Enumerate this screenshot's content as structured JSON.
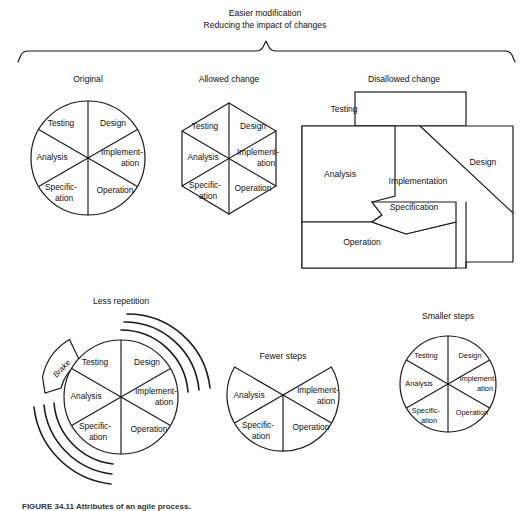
{
  "figure": {
    "header": {
      "line1": "Easier modification",
      "line2": "Reducing the impact of changes"
    },
    "caption": "FIGURE 34.11  Attributes of an agile process."
  },
  "phases": {
    "testing": "Testing",
    "design": "Design",
    "analysis": "Analysis",
    "implementation_line1": "Implement-",
    "implementation_line2": "ation",
    "implementation_full": "Implementation",
    "specification_line1": "Specific-",
    "specification_line2": "ation",
    "specification_full": "Specification",
    "operation": "Operation"
  },
  "panels": [
    {
      "id": "original",
      "title": "Original",
      "shape": "circle",
      "sectors": [
        "Design",
        "Implementation",
        "Operation",
        "Specification",
        "Analysis",
        "Testing"
      ]
    },
    {
      "id": "allowed-change",
      "title": "Allowed change",
      "shape": "hexagon",
      "sectors": [
        "Design",
        "Implementation",
        "Operation",
        "Specification",
        "Analysis",
        "Testing"
      ]
    },
    {
      "id": "disallowed-change",
      "title": "Disallowed change",
      "shape": "irregular-polygon",
      "sectors": [
        "Testing",
        "Analysis",
        "Design",
        "Implementation",
        "Specification",
        "Operation"
      ]
    },
    {
      "id": "less-repetition",
      "title": "Less repetition",
      "shape": "circle-with-brake",
      "sectors": [
        "Design",
        "Implementation",
        "Operation",
        "Specification",
        "Analysis",
        "Testing"
      ],
      "brake_label": "Brake",
      "motion_arc_count": 6
    },
    {
      "id": "fewer-steps",
      "title": "Fewer steps",
      "shape": "partial-circle",
      "sectors": [
        "Implementation",
        "Operation",
        "Specification",
        "Analysis"
      ]
    },
    {
      "id": "smaller-steps",
      "title": "Smaller steps",
      "shape": "circle-small",
      "sectors": [
        "Design",
        "Implementation",
        "Operation",
        "Specification",
        "Analysis",
        "Testing"
      ]
    }
  ]
}
